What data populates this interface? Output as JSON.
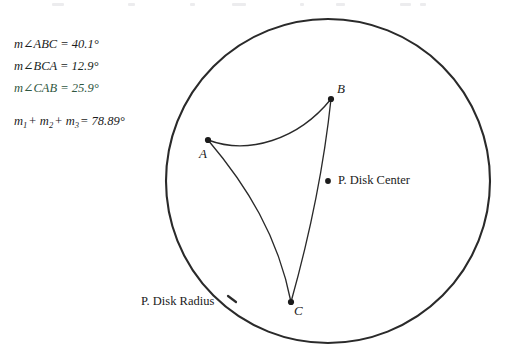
{
  "figure": {
    "title_context": "Poincare disk hyperbolic triangle",
    "measurements": [
      {
        "id": "angle-abc",
        "text": "m∠ABC = 40.1°",
        "value": 40.1,
        "unit": "degrees"
      },
      {
        "id": "angle-bca",
        "text": "m∠BCA = 12.9°",
        "value": 12.9,
        "unit": "degrees"
      },
      {
        "id": "angle-cab",
        "text": "m∠CAB = 25.9°",
        "value": 25.9,
        "unit": "degrees"
      }
    ],
    "sum": {
      "m1": "m",
      "sub1": "1",
      "plus1": "+ ",
      "m2": "m",
      "sub2": "2",
      "plus2": "+ ",
      "m3": "m",
      "sub3": "3",
      "equals": "= 78.89°",
      "value": 78.89,
      "unit": "degrees"
    },
    "vertices": [
      {
        "id": "vertex-a",
        "label": "A",
        "x": 208,
        "y": 140
      },
      {
        "id": "vertex-b",
        "label": "B",
        "x": 331,
        "y": 99
      },
      {
        "id": "vertex-c",
        "label": "C",
        "x": 291,
        "y": 302
      }
    ],
    "center_point": {
      "id": "disk-center",
      "label": "P. Disk Center",
      "x": 328,
      "y": 181
    },
    "radius_annotation": {
      "id": "disk-radius",
      "label": "P. Disk Radius"
    },
    "disk": {
      "cx": 328,
      "cy": 181,
      "r": 162
    },
    "colors": {
      "ink": "#1b1b1b",
      "disk_stroke": "#2a2a2a",
      "geodesic_stroke": "#2a2a2a",
      "accent_green": "#2f5741",
      "background": "#ffffff"
    }
  }
}
